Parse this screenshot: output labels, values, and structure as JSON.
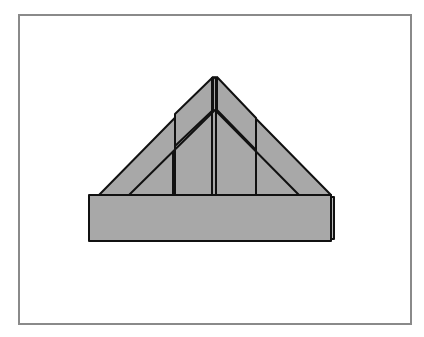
{
  "diagram": {
    "colors": {
      "paper": "#a8a8a8",
      "stroke": "#111111",
      "frame": "#8a8a8a",
      "background": "#ffffff"
    },
    "parts": [
      "outer-triangle",
      "inner-triangle",
      "left-flap",
      "right-flap",
      "center-crease",
      "brim-band",
      "brim-fold-edge"
    ]
  }
}
